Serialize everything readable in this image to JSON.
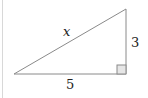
{
  "diagram": {
    "type": "right-triangle",
    "labels": {
      "hypotenuse": "x",
      "vertical_leg": "3",
      "horizontal_leg": "5"
    },
    "right_angle_marker": true,
    "colors": {
      "stroke": "#8a8a8a",
      "marker_fill": "#e6e6e6",
      "text": "#222222"
    }
  }
}
